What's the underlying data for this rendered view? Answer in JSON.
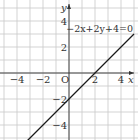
{
  "chart_data": {
    "type": "line",
    "title": "",
    "xlabel": "x",
    "ylabel": "y",
    "origin_label": "O",
    "xlim": [
      -5,
      5
    ],
    "ylim": [
      -5.2,
      5.5
    ],
    "grid": true,
    "grid_step": 1,
    "x_ticks": [
      {
        "value": -4,
        "label": "−4"
      },
      {
        "value": -2,
        "label": "−2"
      },
      {
        "value": 2,
        "label": "2"
      },
      {
        "value": 4,
        "label": "4"
      }
    ],
    "y_ticks": [
      {
        "value": 4,
        "label": "4"
      },
      {
        "value": 2,
        "label": "2"
      },
      {
        "value": -2,
        "label": "−2"
      },
      {
        "value": -4,
        "label": "−4"
      }
    ],
    "series": [
      {
        "name": "-2x+2y+4=0",
        "equation_label": "−2x+2y+4=0",
        "slope": 1,
        "intercept": -2,
        "points": [
          [
            -3.2,
            -5.2
          ],
          [
            5,
            3
          ]
        ],
        "color": "#1a1a1a"
      }
    ]
  }
}
